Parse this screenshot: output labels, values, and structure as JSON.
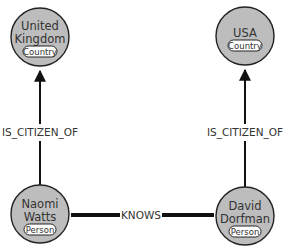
{
  "nodes": {
    "uk": {
      "line1": "United",
      "line2": "Kingdom",
      "label": "Country"
    },
    "usa": {
      "line1": "USA",
      "label": "Country"
    },
    "naomi": {
      "line1": "Naomi",
      "line2": "Watts",
      "label": "Person"
    },
    "david": {
      "line1": "David",
      "line2": "Dorfman",
      "label": "Person"
    }
  },
  "edges": {
    "naomi_uk": {
      "label": "IS_CITIZEN_OF"
    },
    "david_usa": {
      "label": "IS_CITIZEN_OF"
    },
    "naomi_david": {
      "label": "KNOWS"
    }
  },
  "colors": {
    "node_fill": "#bdbdbd",
    "stroke": "#222222",
    "background": "#ffffff"
  }
}
